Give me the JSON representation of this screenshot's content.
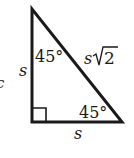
{
  "diagram": {
    "vertices": {
      "top": [
        32,
        9
      ],
      "right_angle": [
        32,
        122
      ],
      "bottom_right": [
        122,
        122
      ]
    },
    "labels": {
      "left_side": "s",
      "bottom_side": "s",
      "hypotenuse_var": "s",
      "hypotenuse_radicand": "2",
      "top_angle": "45°",
      "bottom_angle": "45°",
      "clipped_left_glyph": "c"
    },
    "colors": {
      "stroke": "#1a1a1a",
      "background": "#ffffff"
    }
  }
}
